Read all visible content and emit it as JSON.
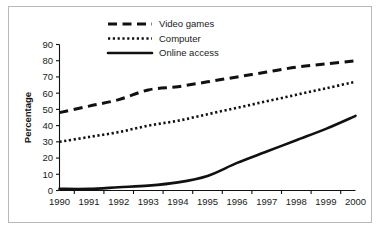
{
  "chart_data": {
    "type": "line",
    "title": "",
    "xlabel": "",
    "ylabel": "Percentage",
    "categories": [
      "1990",
      "1991",
      "1992",
      "1993",
      "1994",
      "1995",
      "1996",
      "1997",
      "1998",
      "1999",
      "2000"
    ],
    "x": [
      1990,
      1991,
      1992,
      1993,
      1994,
      1995,
      1996,
      1997,
      1998,
      1999,
      2000
    ],
    "xlim": [
      1990,
      2000
    ],
    "ylim": [
      0,
      90
    ],
    "yticks": [
      0,
      10,
      20,
      30,
      40,
      50,
      60,
      70,
      80,
      90
    ],
    "ytick_labels": [
      "0",
      "10",
      "20",
      "30",
      "40",
      "50",
      "60",
      "70",
      "80",
      "90"
    ],
    "grid": false,
    "legend_position": "top-center",
    "series": [
      {
        "name": "Video games",
        "style": "dashed",
        "color": "#111111",
        "values": [
          48,
          52,
          56,
          62,
          64,
          67,
          70,
          73,
          76,
          78,
          80
        ]
      },
      {
        "name": "Computer",
        "style": "dotted",
        "color": "#111111",
        "values": [
          30,
          33,
          36,
          40,
          43,
          47,
          51,
          55,
          59,
          63,
          67
        ]
      },
      {
        "name": "Online access",
        "style": "solid",
        "color": "#111111",
        "values": [
          1,
          1,
          2,
          3,
          5,
          9,
          17,
          24,
          31,
          38,
          46
        ]
      }
    ]
  },
  "legend": {
    "items": [
      {
        "label": "Video games"
      },
      {
        "label": "Computer"
      },
      {
        "label": "Online access"
      }
    ]
  },
  "axes": {
    "y_title": "Percentage"
  }
}
